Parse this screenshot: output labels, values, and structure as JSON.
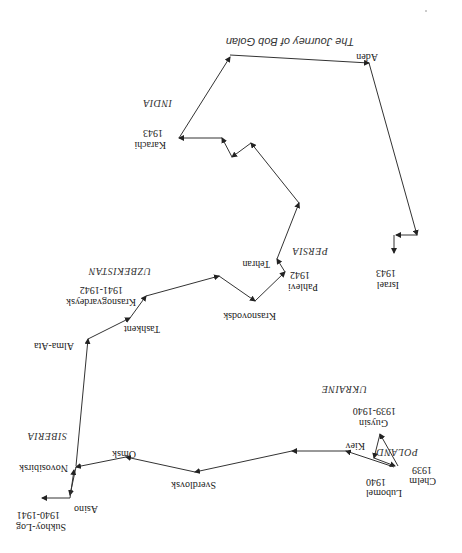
{
  "diagram": {
    "title": "The Journey of Bob Golan",
    "orientation": "rotated 180 degrees",
    "regions": [
      {
        "name": "POLAND"
      },
      {
        "name": "UKRAINE"
      },
      {
        "name": "SIBERIA"
      },
      {
        "name": "UZBEKISTAN"
      },
      {
        "name": "PERSIA"
      },
      {
        "name": "INDIA"
      }
    ],
    "stops": [
      {
        "city": "Chelm",
        "years": "1939"
      },
      {
        "city": "Guysin",
        "years": "1939-1940"
      },
      {
        "city": "Lubomel",
        "years": "1940"
      },
      {
        "city": "Kiev",
        "years": ""
      },
      {
        "city": "Sverdlovsk",
        "years": ""
      },
      {
        "city": "Omsk",
        "years": ""
      },
      {
        "city": "Novosibirsk",
        "years": ""
      },
      {
        "city": "Asino",
        "years": ""
      },
      {
        "city": "Sukhoy-Log",
        "years": "1940-1941"
      },
      {
        "city": "Alma-Ata",
        "years": ""
      },
      {
        "city": "Tashkent",
        "years": ""
      },
      {
        "city": "Krasnogvardeysk",
        "years": "1941-1942"
      },
      {
        "city": "Krasnovodsk",
        "years": ""
      },
      {
        "city": "Pahlevi",
        "years": "1942"
      },
      {
        "city": "Tehran",
        "years": ""
      },
      {
        "city": "Karachi",
        "years": "1943"
      },
      {
        "city": "Aden",
        "years": ""
      },
      {
        "city": "Israel",
        "years": "1943"
      }
    ]
  }
}
